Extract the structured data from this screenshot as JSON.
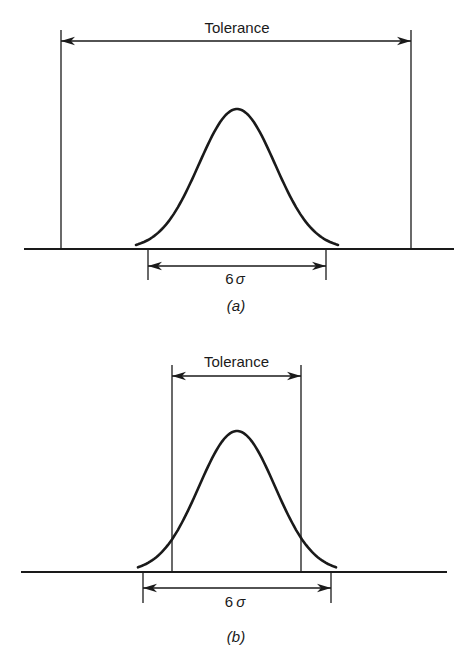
{
  "figure": {
    "panels": [
      {
        "id": "a",
        "caption": "(a)",
        "tolerance_label": "Tolerance",
        "spread_label_num": "6",
        "spread_label_sym": "σ",
        "baseline": {
          "y": 249,
          "x1": 24,
          "x2": 454
        },
        "tolerance": {
          "x1": 61,
          "x2": 411,
          "top": 30,
          "arrow_y": 41,
          "label_y": 34
        },
        "spread": {
          "x1": 148,
          "x2": 326,
          "bottom": 280,
          "arrow_y": 266,
          "label_y": 284
        },
        "curve": {
          "center": 237,
          "peak_y": 109,
          "sigma_px": 38,
          "half_width": 101
        },
        "caption_y": 311
      },
      {
        "id": "b",
        "caption": "(b)",
        "tolerance_label": "Tolerance",
        "spread_label_num": "6",
        "spread_label_sym": "σ",
        "baseline": {
          "y": 572,
          "x1": 21,
          "x2": 447
        },
        "tolerance": {
          "x1": 172,
          "x2": 301,
          "top": 365,
          "arrow_y": 376,
          "label_y": 368
        },
        "spread": {
          "x1": 143,
          "x2": 331,
          "bottom": 603,
          "arrow_y": 588,
          "label_y": 607
        },
        "curve": {
          "center": 237,
          "peak_y": 431,
          "sigma_px": 38,
          "half_width": 99
        },
        "caption_y": 642
      }
    ]
  },
  "chart_data": [
    {
      "type": "line",
      "title": "(a)",
      "description": "Normal distribution whose 6σ spread lies well inside the tolerance limits",
      "annotations": [
        "Tolerance",
        "6σ"
      ],
      "tolerance_width_relative_to_6sigma": 1.97
    },
    {
      "type": "line",
      "title": "(b)",
      "description": "Normal distribution whose 6σ spread exceeds the tolerance limits",
      "annotations": [
        "Tolerance",
        "6σ"
      ],
      "tolerance_width_relative_to_6sigma": 0.69
    }
  ]
}
